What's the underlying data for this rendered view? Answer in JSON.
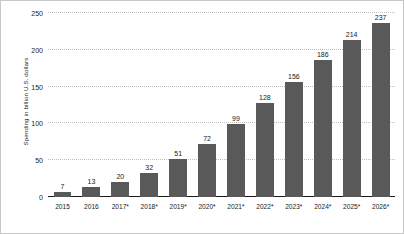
{
  "chart_data": {
    "type": "bar",
    "title": "",
    "subtitle": "",
    "xlabel": "",
    "ylabel": "Spending in billion U.S. dollars",
    "ylim": [
      0,
      250
    ],
    "yticks": [
      250,
      200,
      150,
      100,
      50,
      0
    ],
    "ytick_labels": [
      "250",
      "200",
      "150",
      "100",
      "50",
      "0"
    ],
    "grid": true,
    "grid_axis": "y",
    "legend": false,
    "legend_position": "none",
    "bar_color": "#595959",
    "background_color": "#ffffff",
    "gridline_color": "#bfbfbf",
    "axis_color": "#1a1a1a",
    "categories": [
      "2015",
      "2016",
      "2017*",
      "2018*",
      "2019*",
      "2020*",
      "2021*",
      "2022*",
      "2023*",
      "2024*",
      "2025*",
      "2026*"
    ],
    "values": [
      7,
      13,
      20,
      32,
      51,
      72,
      99,
      128,
      156,
      186,
      214,
      237
    ],
    "value_labels": [
      "7",
      "13",
      "20",
      "32",
      "51",
      "72",
      "99",
      "128",
      "156",
      "186",
      "214",
      "237"
    ],
    "data_labels_shown": true
  }
}
